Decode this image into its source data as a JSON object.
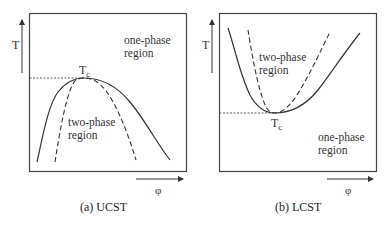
{
  "panels": [
    {
      "id": "ucst",
      "caption": "(a) UCST",
      "y_axis_label": "T",
      "x_axis_label": "φ",
      "critical_point_label": "T",
      "critical_point_subscript": "c",
      "upper_region_label_line1": "one-phase",
      "upper_region_label_line2": "region",
      "lower_region_label_line1": "two-phase",
      "lower_region_label_line2": "region",
      "curve_shape": "inverted-dome (maximum at Tc)"
    },
    {
      "id": "lcst",
      "caption": "(b) LCST",
      "y_axis_label": "T",
      "x_axis_label": "φ",
      "critical_point_label": "T",
      "critical_point_subscript": "c",
      "upper_region_label_line1": "two-phase",
      "upper_region_label_line2": "region",
      "lower_region_label_line1": "one-phase",
      "lower_region_label_line2": "region",
      "curve_shape": "U-shape (minimum at Tc)"
    }
  ],
  "legend_semantics": {
    "solid_line": "binodal",
    "dashed_line": "spinodal",
    "dotted_line": "critical temperature level"
  }
}
